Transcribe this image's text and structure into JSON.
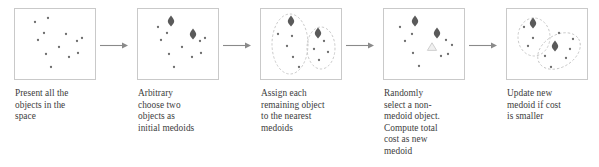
{
  "figure": {
    "colors": {
      "point": "#6e6e6e",
      "medoid": "#5a5a5a",
      "candidate": "#cfcfcf",
      "box_border": "#c9c9c9",
      "ellipse": "#bdbdbd",
      "arrow": "#8a8a8a",
      "text": "#3d3d3d",
      "background": "#ffffff"
    }
  },
  "steps": [
    {
      "index": 1,
      "caption": "Present all the\nobjects in the\nspace",
      "panel_name": "scatter-panel-present-objects",
      "points": [
        {
          "x": 20,
          "y": 13
        },
        {
          "x": 33,
          "y": 9
        },
        {
          "x": 29,
          "y": 24
        },
        {
          "x": 23,
          "y": 31
        },
        {
          "x": 51,
          "y": 25
        },
        {
          "x": 44,
          "y": 38
        },
        {
          "x": 62,
          "y": 32
        },
        {
          "x": 67,
          "y": 29
        },
        {
          "x": 31,
          "y": 45
        },
        {
          "x": 63,
          "y": 44
        },
        {
          "x": 54,
          "y": 48
        },
        {
          "x": 36,
          "y": 58
        }
      ],
      "medoids": [],
      "candidate": null,
      "ellipses": []
    },
    {
      "index": 2,
      "caption": "Arbitrary\nchoose two\nobjects as\ninitial medoids",
      "panel_name": "scatter-panel-initial-medoids",
      "points": [
        {
          "x": 20,
          "y": 18
        },
        {
          "x": 29,
          "y": 24
        },
        {
          "x": 23,
          "y": 31
        },
        {
          "x": 44,
          "y": 38
        },
        {
          "x": 62,
          "y": 32
        },
        {
          "x": 67,
          "y": 29
        },
        {
          "x": 31,
          "y": 45
        },
        {
          "x": 63,
          "y": 44
        },
        {
          "x": 54,
          "y": 48
        },
        {
          "x": 36,
          "y": 58
        }
      ],
      "medoids": [
        {
          "x": 33,
          "y": 12
        },
        {
          "x": 55,
          "y": 25
        }
      ],
      "candidate": null,
      "ellipses": []
    },
    {
      "index": 3,
      "caption": "Assign each\nremaining object\nto the nearest\nmedoids",
      "panel_name": "scatter-panel-assign-clusters",
      "points": [
        {
          "x": 17,
          "y": 25
        },
        {
          "x": 31,
          "y": 27
        },
        {
          "x": 26,
          "y": 37
        },
        {
          "x": 32,
          "y": 48
        },
        {
          "x": 38,
          "y": 58
        },
        {
          "x": 63,
          "y": 32
        },
        {
          "x": 53,
          "y": 40
        },
        {
          "x": 67,
          "y": 43
        },
        {
          "x": 58,
          "y": 51
        }
      ],
      "medoids": [
        {
          "x": 30,
          "y": 12
        },
        {
          "x": 57,
          "y": 24
        }
      ],
      "candidate": null,
      "ellipses": [
        {
          "cx": 29,
          "cy": 35,
          "rx": 18,
          "ry": 30,
          "rotate": 0
        },
        {
          "cx": 60,
          "cy": 39,
          "rx": 14,
          "ry": 21,
          "rotate": 0
        }
      ]
    },
    {
      "index": 4,
      "caption": "Randomly\nselect a non-\nmedoid object.\nCompute total\ncost as new\nmedoid",
      "panel_name": "scatter-panel-random-nonmedoid",
      "points": [
        {
          "x": 16,
          "y": 18
        },
        {
          "x": 28,
          "y": 25
        },
        {
          "x": 21,
          "y": 32
        },
        {
          "x": 62,
          "y": 31
        },
        {
          "x": 68,
          "y": 36
        },
        {
          "x": 29,
          "y": 44
        },
        {
          "x": 57,
          "y": 47
        },
        {
          "x": 64,
          "y": 45
        },
        {
          "x": 35,
          "y": 57
        }
      ],
      "medoids": [
        {
          "x": 31,
          "y": 12
        },
        {
          "x": 53,
          "y": 24
        }
      ],
      "candidate": {
        "x": 48,
        "y": 38
      },
      "ellipses": []
    },
    {
      "index": 5,
      "caption": "Update new\nmedoid if cost\nis smaller",
      "panel_name": "scatter-panel-update-medoid",
      "points": [
        {
          "x": 17,
          "y": 18
        },
        {
          "x": 26,
          "y": 29
        },
        {
          "x": 21,
          "y": 37
        },
        {
          "x": 52,
          "y": 24
        },
        {
          "x": 66,
          "y": 30
        },
        {
          "x": 63,
          "y": 40
        },
        {
          "x": 38,
          "y": 47
        },
        {
          "x": 59,
          "y": 49
        },
        {
          "x": 44,
          "y": 58
        }
      ],
      "medoids": [
        {
          "x": 26,
          "y": 14
        },
        {
          "x": 48,
          "y": 37
        }
      ],
      "candidate": null,
      "ellipses": [
        {
          "cx": 27,
          "cy": 28,
          "rx": 16,
          "ry": 19,
          "rotate": 0
        },
        {
          "cx": 52,
          "cy": 42,
          "rx": 23,
          "ry": 16,
          "rotate": -32
        }
      ]
    }
  ],
  "arrows": [
    {
      "name": "arrow-step1-to-step2"
    },
    {
      "name": "arrow-step2-to-step3"
    },
    {
      "name": "arrow-step3-to-step4"
    },
    {
      "name": "arrow-step4-to-step5"
    }
  ]
}
